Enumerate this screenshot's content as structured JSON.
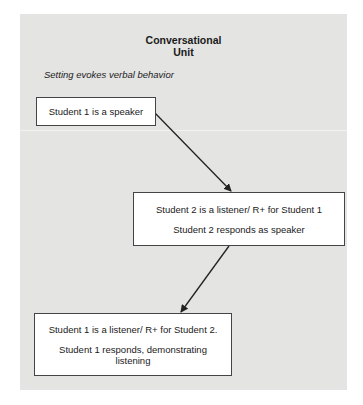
{
  "figure": {
    "title_line1": "Conversational",
    "title_line2": "Unit",
    "subtitle": "Setting evokes verbal behavior",
    "nodes": [
      {
        "id": "box1",
        "lines": [
          "Student 1 is a speaker"
        ]
      },
      {
        "id": "box2",
        "lines": [
          "Student 2 is a listener/ R+ for Student 1",
          "Student 2 responds as speaker"
        ]
      },
      {
        "id": "box3",
        "lines": [
          "Student 1 is a listener/ R+ for Student 2.",
          "Student 1 responds, demonstrating",
          "listening"
        ]
      }
    ],
    "edges": [
      {
        "from": "box1",
        "to": "box2"
      },
      {
        "from": "box2",
        "to": "box3"
      }
    ],
    "colors": {
      "background": "#e4e4e2",
      "box_fill": "#ffffff",
      "stroke": "#222222"
    }
  }
}
